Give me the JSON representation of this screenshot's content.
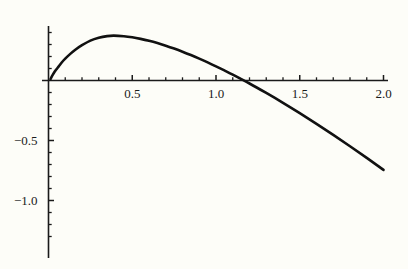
{
  "chart_data": {
    "type": "line",
    "title": "",
    "subtitle": "",
    "xlabel": "",
    "ylabel": "",
    "xlim": [
      -0.06,
      2.02
    ],
    "ylim": [
      -1.42,
      0.47
    ],
    "grid": false,
    "legend": null,
    "axis_style": "mathematica-crossed-axes",
    "line_color": "#111111",
    "line_width": 2.6,
    "background_color": "#fdfdf8",
    "axis_color": "#1a1a1a",
    "x_ticks_major": [
      0.5,
      1.0,
      1.5,
      2.0
    ],
    "x_tick_labels": [
      "0.5",
      "1.0",
      "1.5",
      "2.0"
    ],
    "x_ticks_minor": [
      0.1,
      0.2,
      0.3,
      0.4,
      0.6,
      0.7,
      0.8,
      0.9,
      1.1,
      1.2,
      1.3,
      1.4,
      1.6,
      1.7,
      1.8,
      1.9
    ],
    "y_ticks_major": [
      -0.5,
      -1.0
    ],
    "y_tick_labels": [
      "-0.5",
      "-1.0"
    ],
    "y_ticks_minor": [
      0.1,
      0.2,
      0.3,
      0.4,
      -0.1,
      -0.2,
      -0.3,
      -0.4,
      -0.6,
      -0.7,
      -0.8,
      -0.9,
      -1.1,
      -1.2,
      -1.3
    ],
    "series": [
      {
        "name": "curve",
        "x": [
          0.012,
          0.02,
          0.03,
          0.045,
          0.06,
          0.08,
          0.1,
          0.13,
          0.16,
          0.2,
          0.25,
          0.3,
          0.35,
          0.39,
          0.45,
          0.5,
          0.55,
          0.6,
          0.65,
          0.7,
          0.75,
          0.8,
          0.85,
          0.9,
          0.95,
          1.0,
          1.05,
          1.1,
          1.2,
          1.3,
          1.4,
          1.5,
          1.6,
          1.7,
          1.8,
          1.9,
          2.0
        ],
        "y": [
          0.012,
          0.034,
          0.058,
          0.089,
          0.116,
          0.152,
          0.182,
          0.222,
          0.256,
          0.294,
          0.332,
          0.356,
          0.37,
          0.374,
          0.369,
          0.36,
          0.347,
          0.331,
          0.312,
          0.29,
          0.266,
          0.24,
          0.212,
          0.182,
          0.151,
          0.118,
          0.084,
          0.049,
          -0.025,
          -0.104,
          -0.186,
          -0.272,
          -0.361,
          -0.453,
          -0.548,
          -0.645,
          -0.745
        ]
      }
    ]
  },
  "axis_labels": {
    "x": [
      "0.5",
      "1.0",
      "1.5",
      "2.0"
    ],
    "y": [
      "-0.5",
      "-1.0"
    ]
  }
}
